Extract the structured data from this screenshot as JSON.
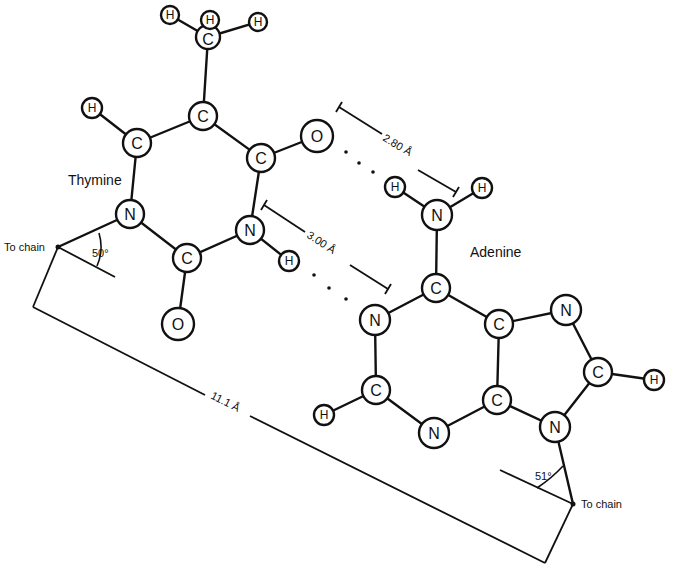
{
  "figure": {
    "type": "chemical-structure-diagram"
  },
  "molecules": {
    "thymine": {
      "label": "Thymine",
      "angle_label": "50°",
      "chain_label": "To chain",
      "atoms": {
        "c_methyl": "C",
        "h_methyl_1": "H",
        "h_methyl_2": "H",
        "h_methyl_3": "H",
        "c5": "C",
        "c6": "C",
        "h6": "H",
        "c4": "C",
        "o4": "O",
        "n1": "N",
        "c2": "C",
        "n3": "N",
        "h3": "H",
        "o2": "O"
      }
    },
    "adenine": {
      "label": "Adenine",
      "angle_label": "51°",
      "chain_label": "To chain",
      "atoms": {
        "n6": "N",
        "h6a": "H",
        "h6b": "H",
        "c6": "C",
        "n1": "N",
        "c2": "C",
        "h2": "H",
        "n3": "N",
        "c4": "C",
        "c5": "C",
        "n7": "N",
        "c8": "C",
        "h8": "H",
        "n9": "N"
      }
    }
  },
  "hydrogen_bonds": [
    {
      "from": "thymine.o4",
      "to": "adenine.n6",
      "distance_label": "2.80 Å"
    },
    {
      "from": "thymine.n3",
      "to": "adenine.n1",
      "distance_label": "3.00 Å"
    }
  ],
  "chain_distance": {
    "label": "11.1 Å"
  }
}
